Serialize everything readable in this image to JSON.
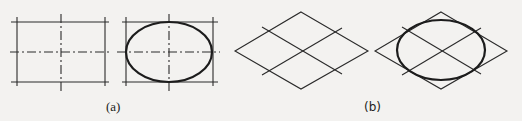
{
  "figure": {
    "panels": [
      {
        "id": "a",
        "label": "(a)",
        "description": "Rectangle with dash-dot center lines, and same rectangle with inscribed ellipse",
        "subfigures": [
          {
            "type": "rectangle-with-centerlines",
            "rect": {
              "x1": 17,
              "y1": 22,
              "x2": 105,
              "y2": 82
            },
            "center": {
              "x": 61,
              "y": 52
            }
          },
          {
            "type": "rectangle-with-ellipse",
            "rect": {
              "x1": 126,
              "y1": 22,
              "x2": 213,
              "y2": 82
            },
            "ellipse": {
              "cx": 169,
              "cy": 52,
              "rx": 43,
              "ry": 30
            }
          }
        ]
      },
      {
        "id": "b",
        "label": "(b)",
        "description": "Rhombus (isometric square) with mid-lines, and same rhombus with inscribed ellipse",
        "subfigures": [
          {
            "type": "rhombus-with-midlines",
            "top": [
              301,
              12
            ],
            "right": [
              368,
              51
            ],
            "bottom": [
              301,
              89
            ],
            "left": [
              235,
              51
            ]
          },
          {
            "type": "rhombus-with-ellipse",
            "top": [
              441,
              12
            ],
            "right": [
              507,
              51
            ],
            "bottom": [
              441,
              89
            ],
            "left": [
              375,
              51
            ],
            "ellipse": {
              "cx": 441,
              "cy": 50,
              "rx": 44,
              "ry": 30
            }
          }
        ]
      }
    ],
    "colors": {
      "line": "#2a2a2a",
      "background": "#f3f2f0"
    }
  }
}
